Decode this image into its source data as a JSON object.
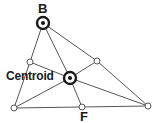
{
  "diagram": {
    "kind": "triangle-medians-centroid",
    "labels": {
      "vertex_b": "B",
      "vertex_f": "F",
      "centroid": "Centroid"
    },
    "colors": {
      "line": "#555555",
      "stroke_dark": "#1a1a1a",
      "node_fill": "#ffffff",
      "background": "#ffffff",
      "text": "#1a1a1a"
    },
    "points": {
      "b": {
        "x": 43,
        "y": 23,
        "name": "vertex-b",
        "marker": "target"
      },
      "left_mid": {
        "x": 30,
        "y": 62,
        "name": "left-midpoint",
        "marker": "circle"
      },
      "right_mid": {
        "x": 97,
        "y": 61,
        "name": "right-midpoint",
        "marker": "circle"
      },
      "centroid": {
        "x": 70,
        "y": 78,
        "name": "centroid-point",
        "marker": "target"
      },
      "bottom_left": {
        "x": 14,
        "y": 108,
        "name": "bottom-left-vertex",
        "marker": "circle"
      },
      "f": {
        "x": 82,
        "y": 107,
        "name": "vertex-f",
        "marker": "circle"
      },
      "bottom_right": {
        "x": 148,
        "y": 106,
        "name": "bottom-right-vertex",
        "marker": "circle"
      }
    },
    "edges": [
      {
        "from": "b",
        "to": "left_mid",
        "name": "edge-b-left-midpoint"
      },
      {
        "from": "b",
        "to": "right_mid",
        "name": "edge-b-right-midpoint"
      },
      {
        "from": "b",
        "to": "centroid",
        "name": "edge-b-centroid"
      },
      {
        "from": "centroid",
        "to": "f",
        "name": "edge-centroid-f"
      },
      {
        "from": "left_mid",
        "to": "centroid",
        "name": "edge-left-midpoint-centroid"
      },
      {
        "from": "centroid",
        "to": "right_mid",
        "name": "edge-centroid-right-midpoint"
      },
      {
        "from": "left_mid",
        "to": "bottom_left",
        "name": "edge-left-midpoint-bottom-left"
      },
      {
        "from": "bottom_left",
        "to": "centroid",
        "name": "edge-bottom-left-centroid"
      },
      {
        "from": "centroid",
        "to": "bottom_right",
        "name": "edge-centroid-bottom-right"
      },
      {
        "from": "right_mid",
        "to": "bottom_right",
        "name": "edge-right-midpoint-bottom-right"
      },
      {
        "from": "bottom_left",
        "to": "f",
        "name": "edge-bottom-left-f"
      },
      {
        "from": "f",
        "to": "bottom_right",
        "name": "edge-f-bottom-right"
      }
    ]
  }
}
